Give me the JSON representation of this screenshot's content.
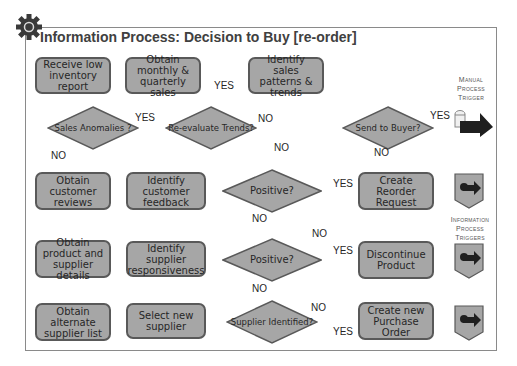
{
  "title": "Information Process: Decision to Buy [re-order]",
  "colors": {
    "box_fill": "#a6a6a6",
    "box_border": "#595959",
    "connector": "#7f7f7f",
    "frame": "#8a8a8a",
    "text": "#262626"
  },
  "icons": {
    "header": "gear-icon",
    "manual_trigger": "manual-trigger-arrow-icon",
    "info_trigger": "gear-arrow-trigger-icon"
  },
  "row1": {
    "receive": "Receive low inventory report",
    "obtain_sales": "Obtain monthly & quarterly sales",
    "identify_patterns": "Identify sales patterns & trends"
  },
  "row2": {
    "anomalies": "Sales Anomalies ?",
    "reevaluate": "Re-evaluate Trends?",
    "send_buyer": "Send to Buyer?"
  },
  "row3": {
    "obtain_reviews": "Obtain customer reviews",
    "identify_feedback": "Identify customer feedback",
    "positive": "Positive?",
    "create_reorder": "Create Reorder Request"
  },
  "row4": {
    "obtain_details": "Obtain product and supplier details",
    "identify_responsiveness": "Identify supplier responsiveness",
    "positive": "Positive?",
    "discontinue": "Discontinue Product"
  },
  "row5": {
    "obtain_alternate": "Obtain alternate supplier list",
    "select_supplier": "Select new supplier",
    "supplier_identified": "Supplier Identified?",
    "create_po": "Create new Purchase Order"
  },
  "labels": {
    "yes": "YES",
    "no": "NO"
  },
  "legend": {
    "manual": [
      "Manual",
      "Process",
      "Trigger"
    ],
    "information": [
      "Information",
      "Process",
      "Triggers"
    ]
  }
}
